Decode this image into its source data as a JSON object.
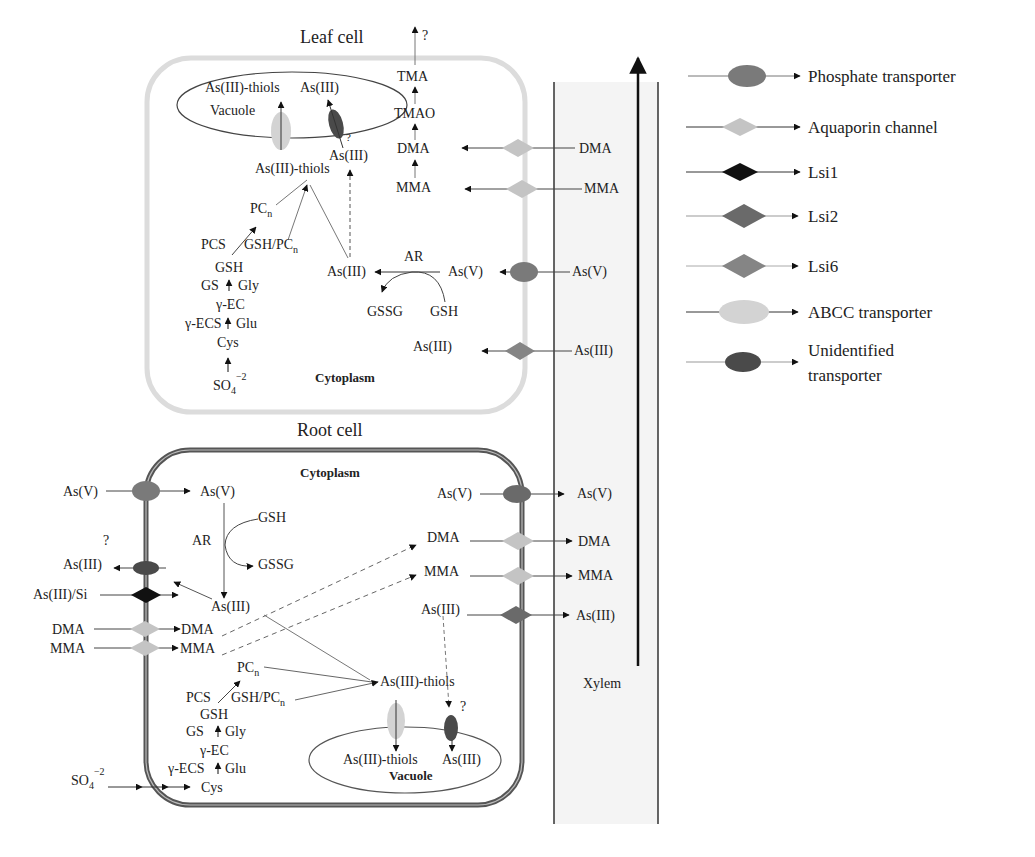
{
  "colors": {
    "phosphate": "#7a7a7a",
    "aquaporin": "#c4c4c4",
    "lsi1": "#111111",
    "lsi2": "#6a6a6a",
    "lsi6": "#858585",
    "abcc": "#d3d3d3",
    "unidentified": "#4a4a4a",
    "leaf_membrane": "#d8d8d8",
    "root_membrane": "#555555",
    "xylem_fill": "#f4f4f4"
  },
  "leaf": {
    "title": "Leaf cell",
    "cytoplasm": "Cytoplasm",
    "vacuole": {
      "label": "Vacuole",
      "thiols": "As(III)-thiols",
      "as3": "As(III)"
    },
    "unknown_mark": "?",
    "as3_under_vac": "As(III)",
    "thiols": "As(III)-thiols",
    "pcn": "PC",
    "pcn_sub": "n",
    "pcs": "PCS",
    "gsh_pcn": "GSH/PC",
    "gsh_pcn_sub": "n",
    "gsh": "GSH",
    "gs": "GS",
    "gly": "Gly",
    "gec": "γ-EC",
    "gecs": "γ-ECS",
    "glu": "Glu",
    "cys": "Cys",
    "so4": "SO",
    "so4_sub": "4",
    "so4_sup": "−2",
    "as3_center": "As(III)",
    "ar": "AR",
    "as5_in": "As(V)",
    "gssg": "GSSG",
    "gsh2": "GSH",
    "as3_in": "As(III)",
    "methyl_chain": [
      "TMA",
      "TMAO",
      "DMA",
      "MMA"
    ],
    "top_unknown": "?",
    "xylem_side": [
      "DMA",
      "MMA",
      "As(V)",
      "As(III)"
    ]
  },
  "root": {
    "title": "Root cell",
    "cytoplasm": "Cytoplasm",
    "left_inputs": {
      "as5": "As(V)",
      "as3_out": "As(III)",
      "unknown_mark": "?",
      "as3si": "As(III)/Si",
      "dma": "DMA",
      "mma": "MMA",
      "so4": "SO",
      "so4_sub": "4",
      "so4_sup": "−2"
    },
    "inner": {
      "as5": "As(V)",
      "ar": "AR",
      "gsh": "GSH",
      "gssg": "GSSG",
      "as3": "As(III)",
      "dma": "DMA",
      "mma": "MMA",
      "pcn": "PC",
      "pcn_sub": "n",
      "pcs": "PCS",
      "gsh_pcn": "GSH/PC",
      "gsh_pcn_sub": "n",
      "gsh2": "GSH",
      "gs": "GS",
      "gly": "Gly",
      "gec": "γ-EC",
      "gecs": "γ-ECS",
      "glu": "Glu",
      "cys": "Cys",
      "thiols": "As(III)-thiols"
    },
    "right_inner": {
      "as5": "As(V)",
      "dma": "DMA",
      "mma": "MMA",
      "as3": "As(III)"
    },
    "xylem_out": {
      "as5": "As(V)",
      "dma": "DMA",
      "mma": "MMA",
      "as3": "As(III)"
    },
    "vacuole": {
      "label": "Vacuole",
      "thiols": "As(III)-thiols",
      "as3": "As(III)",
      "unknown_mark": "?"
    }
  },
  "xylem": {
    "label": "Xylem"
  },
  "legend": {
    "items": [
      {
        "label": "Phosphate transporter",
        "shape": "ellipse",
        "color_key": "phosphate"
      },
      {
        "label": "Aquaporin channel",
        "shape": "diamond",
        "color_key": "aquaporin"
      },
      {
        "label": "Lsi1",
        "shape": "diamond",
        "color_key": "lsi1"
      },
      {
        "label": "Lsi2",
        "shape": "diamond",
        "color_key": "lsi2"
      },
      {
        "label": "Lsi6",
        "shape": "diamond",
        "color_key": "lsi6"
      },
      {
        "label": "ABCC transporter",
        "shape": "ellipse",
        "color_key": "abcc"
      },
      {
        "label_line1": "Unidentified",
        "label_line2": "transporter",
        "shape": "ellipse",
        "color_key": "unidentified"
      }
    ]
  }
}
